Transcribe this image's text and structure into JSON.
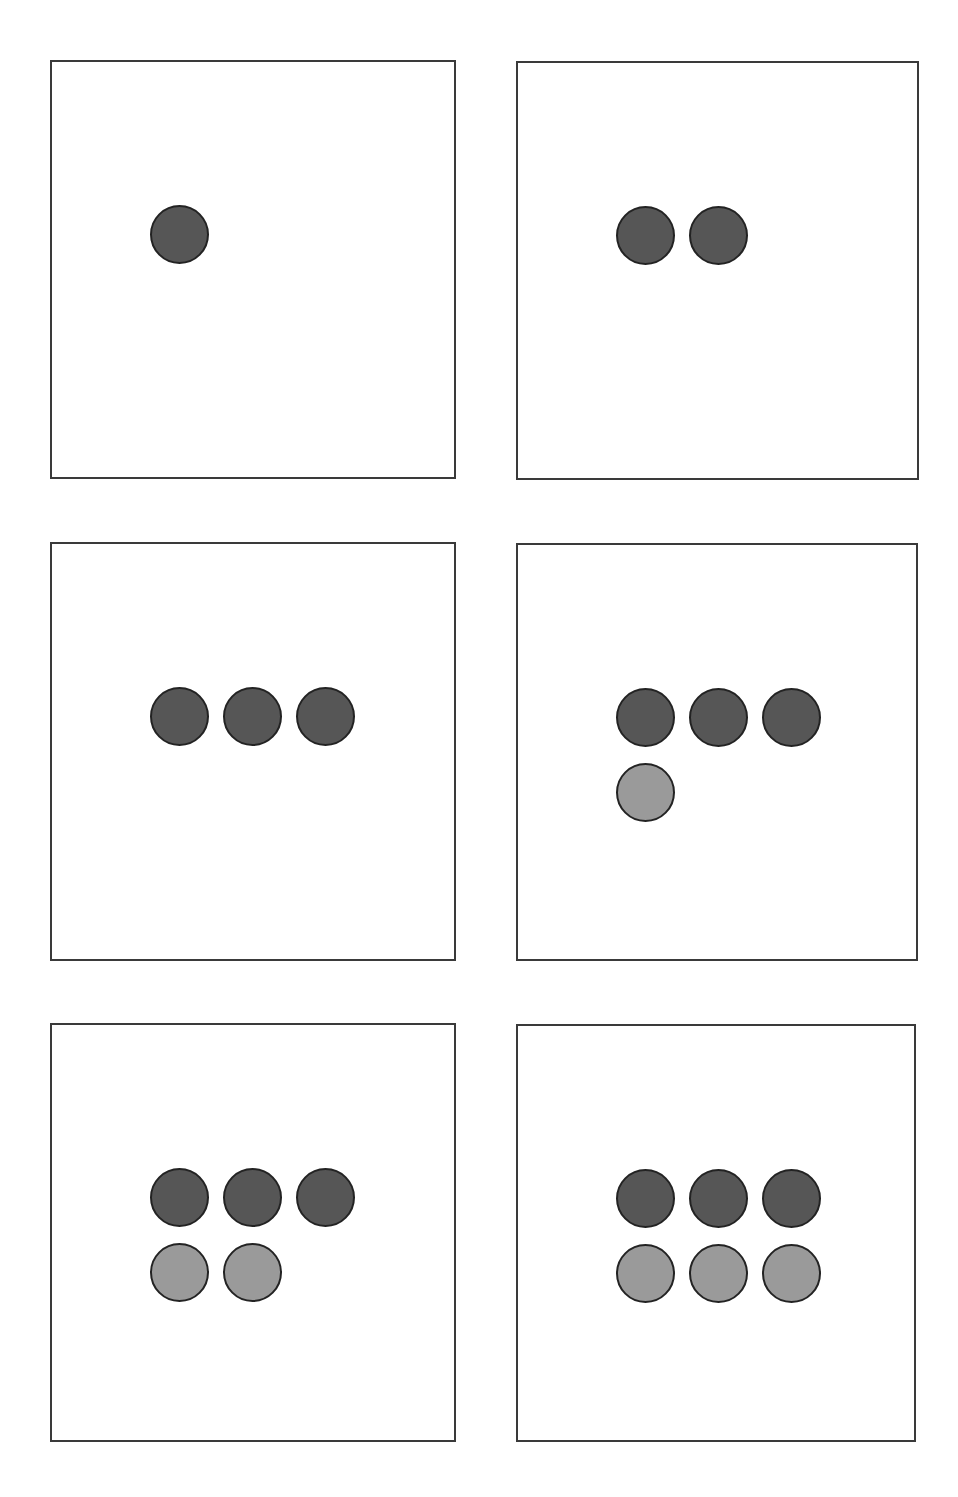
{
  "figure": {
    "colors": {
      "dark": "#565656",
      "light": "#9a9a9a",
      "stroke": "#232323",
      "frame": "#3a3a3a"
    },
    "panels": [
      {
        "id": 1,
        "x": 50,
        "y": 60,
        "w": 406,
        "h": 419,
        "dots": [
          [
            "dark"
          ]
        ]
      },
      {
        "id": 2,
        "x": 516,
        "y": 61,
        "w": 403,
        "h": 419,
        "dots": [
          [
            "dark",
            "dark"
          ]
        ]
      },
      {
        "id": 3,
        "x": 50,
        "y": 542,
        "w": 406,
        "h": 419,
        "dots": [
          [
            "dark",
            "dark",
            "dark"
          ]
        ]
      },
      {
        "id": 4,
        "x": 516,
        "y": 543,
        "w": 402,
        "h": 418,
        "dots": [
          [
            "dark",
            "dark",
            "dark"
          ],
          [
            "light"
          ]
        ]
      },
      {
        "id": 5,
        "x": 50,
        "y": 1023,
        "w": 406,
        "h": 419,
        "dots": [
          [
            "dark",
            "dark",
            "dark"
          ],
          [
            "light",
            "light"
          ]
        ]
      },
      {
        "id": 6,
        "x": 516,
        "y": 1024,
        "w": 400,
        "h": 418,
        "dots": [
          [
            "dark",
            "dark",
            "dark"
          ],
          [
            "light",
            "light",
            "light"
          ]
        ]
      }
    ]
  }
}
